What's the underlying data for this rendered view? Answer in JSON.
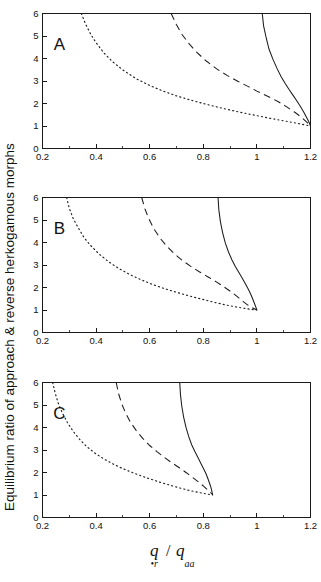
{
  "figure": {
    "ylabel": "Equilibrium ratio of approach & reverse herkogamous morphs",
    "xlabel_numerator": "q",
    "xlabel_numerator_sub": "•r",
    "xlabel_separator": "/",
    "xlabel_denominator": "q",
    "xlabel_denominator_sub": "aa",
    "panel_letters": [
      "A",
      "B",
      "C"
    ]
  },
  "chart_data": [
    {
      "type": "line",
      "panel": "A",
      "title": "A",
      "xlabel": "q•r / qaa",
      "ylabel": "Equilibrium ratio of approach & reverse herkogamous morphs",
      "xlim": [
        0.2,
        1.2
      ],
      "ylim": [
        0,
        6
      ],
      "xticks": [
        0.2,
        0.4,
        0.6,
        0.8,
        1.0,
        1.2
      ],
      "xticklabels": [
        "0.2",
        "0.4",
        "0.6",
        "0.8",
        "1",
        "1.2"
      ],
      "xminorticks": [
        0.3,
        0.5,
        0.7,
        0.9,
        1.1
      ],
      "yticks": [
        0,
        1,
        2,
        3,
        4,
        5,
        6
      ],
      "yticklabels": [
        "0",
        "1",
        "2",
        "3",
        "4",
        "5",
        "6"
      ],
      "grid": false,
      "legend": "none",
      "convergence_point": [
        1.2,
        1.0
      ],
      "series": [
        {
          "name": "dotted",
          "style": "dotted",
          "x_at_ymax": 0.345,
          "x_at_y1": 1.2,
          "points": [
            [
              0.345,
              6.0
            ],
            [
              0.36,
              5.55
            ],
            [
              0.38,
              5.08
            ],
            [
              0.4,
              4.7
            ],
            [
              0.43,
              4.24
            ],
            [
              0.46,
              3.87
            ],
            [
              0.5,
              3.49
            ],
            [
              0.55,
              3.1
            ],
            [
              0.6,
              2.8
            ],
            [
              0.65,
              2.55
            ],
            [
              0.7,
              2.34
            ],
            [
              0.75,
              2.16
            ],
            [
              0.8,
              2.0
            ],
            [
              0.85,
              1.85
            ],
            [
              0.9,
              1.71
            ],
            [
              0.95,
              1.58
            ],
            [
              1.0,
              1.46
            ],
            [
              1.05,
              1.34
            ],
            [
              1.1,
              1.23
            ],
            [
              1.15,
              1.12
            ],
            [
              1.2,
              1.0
            ]
          ]
        },
        {
          "name": "dashed",
          "style": "dashed",
          "x_at_ymax": 0.68,
          "x_at_y1": 1.2,
          "points": [
            [
              0.68,
              6.0
            ],
            [
              0.7,
              5.5
            ],
            [
              0.72,
              5.08
            ],
            [
              0.745,
              4.68
            ],
            [
              0.775,
              4.28
            ],
            [
              0.81,
              3.9
            ],
            [
              0.85,
              3.54
            ],
            [
              0.89,
              3.24
            ],
            [
              0.93,
              2.98
            ],
            [
              0.97,
              2.74
            ],
            [
              1.0,
              2.55
            ],
            [
              1.04,
              2.32
            ],
            [
              1.08,
              2.08
            ],
            [
              1.11,
              1.86
            ],
            [
              1.14,
              1.62
            ],
            [
              1.165,
              1.4
            ],
            [
              1.185,
              1.18
            ],
            [
              1.2,
              1.0
            ]
          ]
        },
        {
          "name": "solid",
          "style": "solid",
          "x_at_ymax": 1.02,
          "x_at_y1": 1.2,
          "points": [
            [
              1.02,
              6.0
            ],
            [
              1.025,
              5.45
            ],
            [
              1.035,
              4.9
            ],
            [
              1.045,
              4.42
            ],
            [
              1.06,
              3.96
            ],
            [
              1.075,
              3.56
            ],
            [
              1.09,
              3.2
            ],
            [
              1.105,
              2.9
            ],
            [
              1.12,
              2.62
            ],
            [
              1.135,
              2.36
            ],
            [
              1.15,
              2.1
            ],
            [
              1.162,
              1.88
            ],
            [
              1.173,
              1.66
            ],
            [
              1.182,
              1.46
            ],
            [
              1.19,
              1.28
            ],
            [
              1.196,
              1.12
            ],
            [
              1.2,
              1.0
            ]
          ]
        }
      ]
    },
    {
      "type": "line",
      "panel": "B",
      "title": "B",
      "xlabel": "q•r / qaa",
      "ylabel": "Equilibrium ratio of approach & reverse herkogamous morphs",
      "xlim": [
        0.2,
        1.2
      ],
      "ylim": [
        0,
        6
      ],
      "xticks": [
        0.2,
        0.4,
        0.6,
        0.8,
        1.0,
        1.2
      ],
      "xticklabels": [
        "0.2",
        "0.4",
        "0.6",
        "0.8",
        "1",
        "1.2"
      ],
      "xminorticks": [
        0.3,
        0.5,
        0.7,
        0.9,
        1.1
      ],
      "yticks": [
        0,
        1,
        2,
        3,
        4,
        5,
        6
      ],
      "yticklabels": [
        "0",
        "1",
        "2",
        "3",
        "4",
        "5",
        "6"
      ],
      "grid": false,
      "legend": "none",
      "convergence_point": [
        1.0,
        1.0
      ],
      "series": [
        {
          "name": "dotted",
          "style": "dotted",
          "x_at_ymax": 0.29,
          "x_at_y1": 1.0,
          "points": [
            [
              0.29,
              6.0
            ],
            [
              0.3,
              5.52
            ],
            [
              0.315,
              5.05
            ],
            [
              0.335,
              4.62
            ],
            [
              0.355,
              4.22
            ],
            [
              0.38,
              3.86
            ],
            [
              0.41,
              3.5
            ],
            [
              0.445,
              3.16
            ],
            [
              0.485,
              2.84
            ],
            [
              0.525,
              2.58
            ],
            [
              0.565,
              2.36
            ],
            [
              0.605,
              2.16
            ],
            [
              0.645,
              1.99
            ],
            [
              0.685,
              1.84
            ],
            [
              0.725,
              1.7
            ],
            [
              0.765,
              1.57
            ],
            [
              0.805,
              1.45
            ],
            [
              0.845,
              1.33
            ],
            [
              0.885,
              1.22
            ],
            [
              0.925,
              1.13
            ],
            [
              0.965,
              1.05
            ],
            [
              1.0,
              1.0
            ]
          ]
        },
        {
          "name": "dashed",
          "style": "dashed",
          "x_at_ymax": 0.57,
          "x_at_y1": 1.0,
          "points": [
            [
              0.57,
              6.0
            ],
            [
              0.582,
              5.5
            ],
            [
              0.597,
              5.05
            ],
            [
              0.615,
              4.62
            ],
            [
              0.637,
              4.22
            ],
            [
              0.662,
              3.86
            ],
            [
              0.69,
              3.52
            ],
            [
              0.72,
              3.22
            ],
            [
              0.752,
              2.95
            ],
            [
              0.785,
              2.7
            ],
            [
              0.818,
              2.47
            ],
            [
              0.85,
              2.24
            ],
            [
              0.878,
              2.02
            ],
            [
              0.905,
              1.8
            ],
            [
              0.928,
              1.58
            ],
            [
              0.948,
              1.38
            ],
            [
              0.966,
              1.22
            ],
            [
              0.983,
              1.1
            ],
            [
              1.0,
              1.0
            ]
          ]
        },
        {
          "name": "solid",
          "style": "solid",
          "x_at_ymax": 0.855,
          "x_at_y1": 1.0,
          "points": [
            [
              0.855,
              6.0
            ],
            [
              0.858,
              5.45
            ],
            [
              0.864,
              4.92
            ],
            [
              0.872,
              4.44
            ],
            [
              0.882,
              3.98
            ],
            [
              0.894,
              3.58
            ],
            [
              0.907,
              3.22
            ],
            [
              0.92,
              2.92
            ],
            [
              0.934,
              2.64
            ],
            [
              0.947,
              2.38
            ],
            [
              0.958,
              2.14
            ],
            [
              0.968,
              1.92
            ],
            [
              0.977,
              1.7
            ],
            [
              0.984,
              1.5
            ],
            [
              0.99,
              1.32
            ],
            [
              0.995,
              1.16
            ],
            [
              1.0,
              1.0
            ]
          ]
        }
      ]
    },
    {
      "type": "line",
      "panel": "C",
      "title": "C",
      "xlabel": "q•r / qaa",
      "ylabel": "Equilibrium ratio of approach & reverse herkogamous morphs",
      "xlim": [
        0.2,
        1.2
      ],
      "ylim": [
        0,
        6
      ],
      "xticks": [
        0.2,
        0.4,
        0.6,
        0.8,
        1.0,
        1.2
      ],
      "xticklabels": [
        "0.2",
        "0.4",
        "0.6",
        "0.8",
        "1",
        "1.2"
      ],
      "xminorticks": [
        0.3,
        0.5,
        0.7,
        0.9,
        1.1
      ],
      "yticks": [
        0,
        1,
        2,
        3,
        4,
        5,
        6
      ],
      "yticklabels": [
        "0",
        "1",
        "2",
        "3",
        "4",
        "5",
        "6"
      ],
      "grid": false,
      "legend": "none",
      "convergence_point": [
        0.835,
        1.0
      ],
      "series": [
        {
          "name": "dotted",
          "style": "dotted",
          "x_at_ymax": 0.238,
          "x_at_y1": 0.835,
          "points": [
            [
              0.238,
              6.0
            ],
            [
              0.248,
              5.5
            ],
            [
              0.26,
              5.04
            ],
            [
              0.275,
              4.62
            ],
            [
              0.293,
              4.22
            ],
            [
              0.314,
              3.84
            ],
            [
              0.338,
              3.48
            ],
            [
              0.366,
              3.14
            ],
            [
              0.398,
              2.84
            ],
            [
              0.432,
              2.58
            ],
            [
              0.466,
              2.36
            ],
            [
              0.5,
              2.17
            ],
            [
              0.535,
              2.0
            ],
            [
              0.57,
              1.84
            ],
            [
              0.605,
              1.7
            ],
            [
              0.64,
              1.56
            ],
            [
              0.675,
              1.44
            ],
            [
              0.71,
              1.32
            ],
            [
              0.745,
              1.21
            ],
            [
              0.78,
              1.12
            ],
            [
              0.81,
              1.05
            ],
            [
              0.835,
              1.0
            ]
          ]
        },
        {
          "name": "dashed",
          "style": "dashed",
          "x_at_ymax": 0.475,
          "x_at_y1": 0.835,
          "points": [
            [
              0.475,
              6.0
            ],
            [
              0.484,
              5.5
            ],
            [
              0.496,
              5.04
            ],
            [
              0.511,
              4.62
            ],
            [
              0.529,
              4.22
            ],
            [
              0.55,
              3.86
            ],
            [
              0.574,
              3.52
            ],
            [
              0.6,
              3.2
            ],
            [
              0.628,
              2.92
            ],
            [
              0.656,
              2.66
            ],
            [
              0.684,
              2.42
            ],
            [
              0.712,
              2.2
            ],
            [
              0.738,
              1.98
            ],
            [
              0.762,
              1.76
            ],
            [
              0.784,
              1.56
            ],
            [
              0.802,
              1.38
            ],
            [
              0.817,
              1.22
            ],
            [
              0.828,
              1.1
            ],
            [
              0.835,
              1.0
            ]
          ]
        },
        {
          "name": "solid",
          "style": "solid",
          "x_at_ymax": 0.712,
          "x_at_y1": 0.835,
          "points": [
            [
              0.712,
              6.0
            ],
            [
              0.715,
              5.44
            ],
            [
              0.72,
              4.92
            ],
            [
              0.727,
              4.44
            ],
            [
              0.736,
              3.98
            ],
            [
              0.746,
              3.58
            ],
            [
              0.757,
              3.22
            ],
            [
              0.769,
              2.92
            ],
            [
              0.781,
              2.64
            ],
            [
              0.792,
              2.38
            ],
            [
              0.802,
              2.14
            ],
            [
              0.811,
              1.92
            ],
            [
              0.818,
              1.7
            ],
            [
              0.824,
              1.5
            ],
            [
              0.829,
              1.32
            ],
            [
              0.832,
              1.16
            ],
            [
              0.835,
              1.0
            ]
          ]
        }
      ]
    }
  ]
}
